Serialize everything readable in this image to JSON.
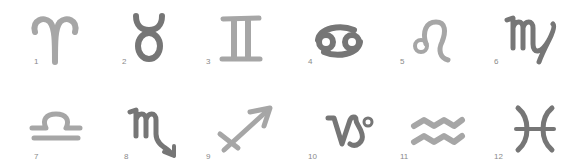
{
  "colors": {
    "light": "#a6a6a6",
    "dark": "#767676",
    "label": "#8a8a8a",
    "background": "#ffffff"
  },
  "signs": [
    {
      "number": "1",
      "icon": "aries-icon",
      "name": "Aries"
    },
    {
      "number": "2",
      "icon": "taurus-icon",
      "name": "Taurus"
    },
    {
      "number": "3",
      "icon": "gemini-icon",
      "name": "Gemini"
    },
    {
      "number": "4",
      "icon": "cancer-icon",
      "name": "Cancer"
    },
    {
      "number": "5",
      "icon": "leo-icon",
      "name": "Leo"
    },
    {
      "number": "6",
      "icon": "virgo-icon",
      "name": "Virgo"
    },
    {
      "number": "7",
      "icon": "libra-icon",
      "name": "Libra"
    },
    {
      "number": "8",
      "icon": "scorpio-icon",
      "name": "Scorpio"
    },
    {
      "number": "9",
      "icon": "sagittarius-icon",
      "name": "Sagittarius"
    },
    {
      "number": "10",
      "icon": "capricorn-icon",
      "name": "Capricorn"
    },
    {
      "number": "11",
      "icon": "aquarius-icon",
      "name": "Aquarius"
    },
    {
      "number": "12",
      "icon": "pisces-icon",
      "name": "Pisces"
    }
  ]
}
